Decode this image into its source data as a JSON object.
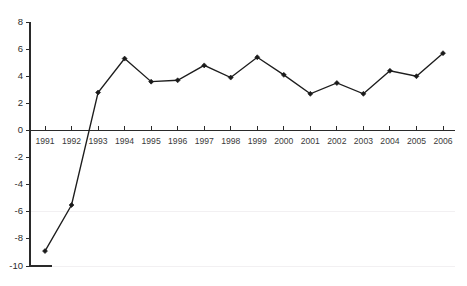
{
  "chart_data": {
    "type": "line",
    "title": "",
    "subtitle": "",
    "xlabel": "",
    "ylabel": "",
    "categories": [
      "1991",
      "1992",
      "1993",
      "1994",
      "1995",
      "1996",
      "1997",
      "1998",
      "1999",
      "2000",
      "2001",
      "2002",
      "2003",
      "2004",
      "2005",
      "2006"
    ],
    "values": [
      -8.9,
      -5.5,
      2.8,
      5.3,
      3.6,
      3.7,
      4.8,
      3.9,
      5.4,
      4.1,
      2.7,
      3.5,
      2.7,
      4.4,
      4.0,
      5.7
    ],
    "series": [
      {
        "name": "",
        "values": [
          -8.9,
          -5.5,
          2.8,
          5.3,
          3.6,
          3.7,
          4.8,
          3.9,
          5.4,
          4.1,
          2.7,
          3.5,
          2.7,
          4.4,
          4.0,
          5.7
        ]
      }
    ],
    "ylim": [
      -10,
      8
    ],
    "xlim_categories": [
      "1991",
      "2006"
    ],
    "yticks": [
      8,
      6,
      4,
      2,
      0,
      -2,
      -4,
      -6,
      -8,
      -10
    ],
    "ytick_labels": [
      "8",
      "6",
      "4",
      "2",
      "0",
      "-2",
      "-4",
      "-6",
      "-8",
      "-10"
    ],
    "grid": false,
    "legend": false,
    "legend_position": "none",
    "marker": "diamond",
    "line_color": "#1d1d1d",
    "marker_color": "#1a1a1a",
    "axis_color": "#2a2a2a",
    "background_color": "#ffffff",
    "zero_line_value": 0,
    "annotations": []
  },
  "title_remnant": {
    "text": ""
  }
}
